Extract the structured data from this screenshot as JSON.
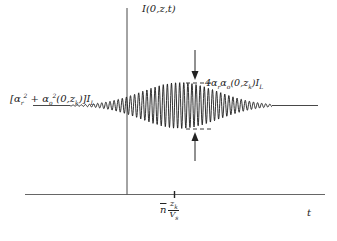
{
  "diagram": {
    "type": "signal-intensity-plot",
    "y_axis_label": "I(0,z,t)",
    "x_axis_label": "t",
    "baseline_label": "[α_r² + α_o²(0,z_k)]I_L",
    "baseline_label_parts": {
      "open": "[",
      "a1": "α",
      "a1_sub": "r",
      "a1_sup": "2",
      "plus": " + ",
      "a2": "α",
      "a2_sub": "o",
      "a2_sup": "2",
      "args": "(0,z",
      "args_sub": "k",
      "close": ")]I",
      "close_sub": "L"
    },
    "amplitude_label": "4α_r α_o(0,z_k)I_L",
    "amplitude_label_parts": {
      "coef": "4α",
      "s1": "r",
      "a2": "α",
      "s2": "o",
      "args": "(0,z",
      "args_sub": "k",
      "close": ")I",
      "close_sub": "L"
    },
    "tick_label": "n̄ z_k / V_s",
    "tick_label_parts": {
      "n": "n",
      "num": "z",
      "num_sub": "k",
      "den": "V",
      "den_sub": "s"
    },
    "colors": {
      "line": "#222222",
      "background": "#ffffff"
    }
  }
}
